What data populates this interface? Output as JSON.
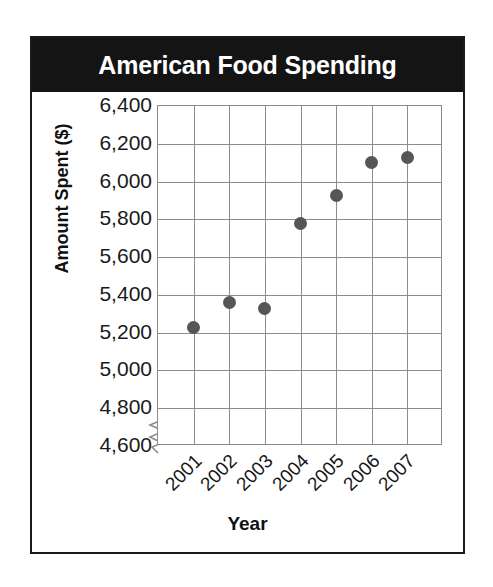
{
  "card": {
    "title": "American Food Spending"
  },
  "chart_data": {
    "type": "scatter",
    "title": "American Food Spending",
    "xlabel": "Year",
    "ylabel": "Amount Spent ($)",
    "categories": [
      "2001",
      "2002",
      "2003",
      "2004",
      "2005",
      "2006",
      "2007"
    ],
    "values": [
      5230,
      5360,
      5330,
      5780,
      5925,
      6100,
      6130
    ],
    "ytick_labels": [
      "6,400",
      "6,200",
      "6,000",
      "5,800",
      "5,600",
      "5,400",
      "5,200",
      "5,000",
      "4,800",
      "4,600"
    ],
    "ytick_values": [
      6400,
      6200,
      6000,
      5800,
      5600,
      5400,
      5200,
      5000,
      4800,
      4600
    ],
    "ylim": [
      4800,
      6400
    ],
    "axis_break": true,
    "axis_break_between": [
      4600,
      4800
    ],
    "grid": true,
    "legend": "none",
    "marker_color": "#565656",
    "grid_color": "#8c8c8c",
    "title_background": "#141414",
    "title_color": "#ffffff"
  }
}
